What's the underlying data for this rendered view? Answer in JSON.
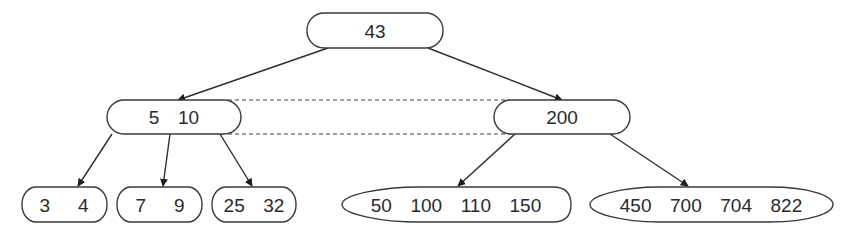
{
  "diagram": {
    "type": "B-tree",
    "nodes": {
      "root": {
        "label": "43",
        "keys": [
          43
        ]
      },
      "internal_left": {
        "label": "5  10",
        "keys": [
          5,
          10
        ]
      },
      "internal_right": {
        "label": "200",
        "keys": [
          200
        ]
      },
      "leaf_1": {
        "label": "3   4",
        "keys": [
          3,
          4
        ]
      },
      "leaf_2": {
        "label": "7   9",
        "keys": [
          7,
          9
        ]
      },
      "leaf_3": {
        "label": "25  32",
        "keys": [
          25,
          32
        ]
      },
      "leaf_4": {
        "label": "50  100  110  150",
        "keys": [
          50,
          100,
          110,
          150
        ]
      },
      "leaf_5": {
        "label": "450  700  704  822",
        "keys": [
          450,
          700,
          704,
          822
        ]
      }
    },
    "edges": [
      {
        "from": "root",
        "to": "internal_left",
        "style": "arrow"
      },
      {
        "from": "root",
        "to": "internal_right",
        "style": "arrow"
      },
      {
        "from": "internal_left",
        "to": "leaf_1",
        "style": "arrow"
      },
      {
        "from": "internal_left",
        "to": "leaf_2",
        "style": "arrow"
      },
      {
        "from": "internal_left",
        "to": "leaf_3",
        "style": "arrow"
      },
      {
        "from": "internal_right",
        "to": "leaf_4",
        "style": "arrow"
      },
      {
        "from": "internal_right",
        "to": "leaf_5",
        "style": "arrow"
      },
      {
        "from": "internal_left",
        "to": "internal_right",
        "style": "dashed-top"
      },
      {
        "from": "internal_left",
        "to": "internal_right",
        "style": "dashed-bottom"
      }
    ],
    "colors": {
      "stroke": "#3a3a3a",
      "text": "#2a2a2a",
      "background": "#ffffff"
    }
  }
}
